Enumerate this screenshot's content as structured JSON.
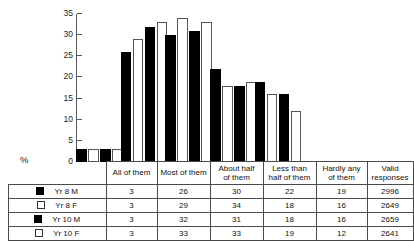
{
  "chart_data": {
    "type": "bar",
    "title": "",
    "xlabel": "",
    "ylabel": "%",
    "ylim": [
      0,
      35
    ],
    "yticks": [
      0,
      5,
      10,
      15,
      20,
      25,
      30,
      35
    ],
    "grid": false,
    "legend_position": "table-left",
    "categories": [
      "All of them",
      "Most of them",
      "About half of them",
      "Less than half of them",
      "Hardly any of them"
    ],
    "series": [
      {
        "name": "Yr 8 M",
        "swatch": "filled",
        "values": [
          3,
          26,
          30,
          22,
          19
        ],
        "valid_responses": 2996
      },
      {
        "name": "Yr 8 F",
        "swatch": "hollow",
        "values": [
          3,
          29,
          34,
          18,
          16
        ],
        "valid_responses": 2649
      },
      {
        "name": "Yr 10 M",
        "swatch": "filled",
        "values": [
          3,
          32,
          31,
          18,
          16
        ],
        "valid_responses": 2659
      },
      {
        "name": "Yr 10 F",
        "swatch": "hollow",
        "values": [
          3,
          33,
          33,
          19,
          12
        ],
        "valid_responses": 2641
      }
    ],
    "colors": {
      "male_bar": "#000000",
      "female_bar": "#ffffff",
      "outline": "#555555",
      "axis": "#555555"
    }
  },
  "axis": {
    "y_title": "%",
    "ticks": [
      "35",
      "30",
      "25",
      "20",
      "15",
      "10",
      "5",
      "0"
    ]
  },
  "table": {
    "headers": [
      {
        "line1": "All of them",
        "line2": ""
      },
      {
        "line1": "Most of them",
        "line2": ""
      },
      {
        "line1": "About half",
        "line2": "of them"
      },
      {
        "line1": "Less than",
        "line2": "half of them"
      },
      {
        "line1": "Hardly any",
        "line2": "of them"
      },
      {
        "line1": "Valid",
        "line2": "responses"
      }
    ],
    "rows": [
      {
        "label": "Yr 8 M",
        "swatch": "filled",
        "cells": [
          "3",
          "26",
          "30",
          "22",
          "19",
          "2996"
        ]
      },
      {
        "label": "Yr 8 F",
        "swatch": "hollow",
        "cells": [
          "3",
          "29",
          "34",
          "18",
          "16",
          "2649"
        ]
      },
      {
        "label": "Yr 10 M",
        "swatch": "filled",
        "cells": [
          "3",
          "32",
          "31",
          "18",
          "16",
          "2659"
        ]
      },
      {
        "label": "Yr 10 F",
        "swatch": "hollow",
        "cells": [
          "3",
          "33",
          "33",
          "19",
          "12",
          "2641"
        ]
      }
    ]
  }
}
